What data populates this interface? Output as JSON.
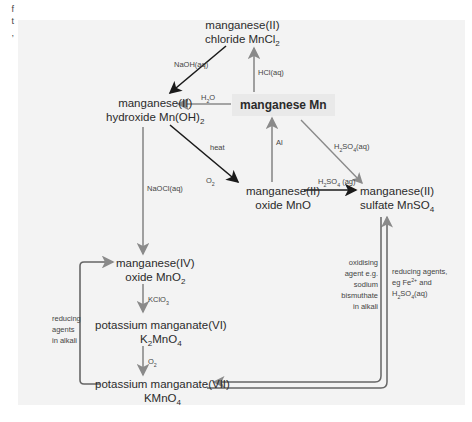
{
  "edge_text": [
    "f",
    "t",
    ","
  ],
  "nodes": {
    "mn": "manganese Mn",
    "mncl2_l1": "manganese(II)",
    "mncl2_l2": "chloride MnCl",
    "mncl2_sub": "2",
    "mnoh2_l1": "manganese(II)",
    "mnoh2_l2": "hydroxide Mn(OH)",
    "mnoh2_sub": "2",
    "mno_l1": "manganese(II)",
    "mno_l2": "oxide MnO",
    "mnso4_l1": "manganese(II)",
    "mnso4_l2": "sulfate MnSO",
    "mnso4_sub": "4",
    "mno2_l1": "manganese(IV)",
    "mno2_l2": "oxide MnO",
    "mno2_sub": "2",
    "k2mno4_l1": "potassium manganate(VI)",
    "k2mno4_l2a": "K",
    "k2mno4_sub1": "2",
    "k2mno4_l2b": "MnO",
    "k2mno4_sub2": "4",
    "kmno4_l1": "potassium manganate(VII)",
    "kmno4_l2": "KMnO",
    "kmno4_sub": "4"
  },
  "labels": {
    "naoh": "NaOH(aq)",
    "hcl": "HCl(aq)",
    "h2o_a": "H",
    "h2o_sub": "2",
    "h2o_b": "O",
    "heat": "heat",
    "o2_a": "O",
    "o2_sub": "2",
    "al": "Al",
    "h2so4_top_a": "H",
    "h2so4_top_sub1": "2",
    "h2so4_top_b": "SO",
    "h2so4_top_sub2": "4",
    "h2so4_top_c": "(aq)",
    "h2so4_mid_a": "H",
    "h2so4_mid_sub1": "2",
    "h2so4_mid_b": "SO",
    "h2so4_mid_sub2": "4",
    "h2so4_mid_c": " (ag)",
    "naocl": "NaOCl(aq)",
    "kclo3_a": "KClO",
    "kclo3_sub": "3",
    "o2b_a": "O",
    "o2b_sub": "2",
    "reducing_alkali": "reducing agents in alkali",
    "oxidising": "oxidising agent e.g. sodium bismuthate in alkali",
    "reducing_acid_a": "reducing agents, eg Fe",
    "reducing_acid_sup": "2+",
    "reducing_acid_b": " and H",
    "reducing_acid_sub1": "2",
    "reducing_acid_c": "SO",
    "reducing_acid_sub2": "4",
    "reducing_acid_d": "(aq)"
  },
  "colors": {
    "panel": "#f3f3f3",
    "main_box": "#e9e9e9",
    "dark_arrow": "#1a1a1a",
    "grey_arrow": "#8a8a8a"
  }
}
